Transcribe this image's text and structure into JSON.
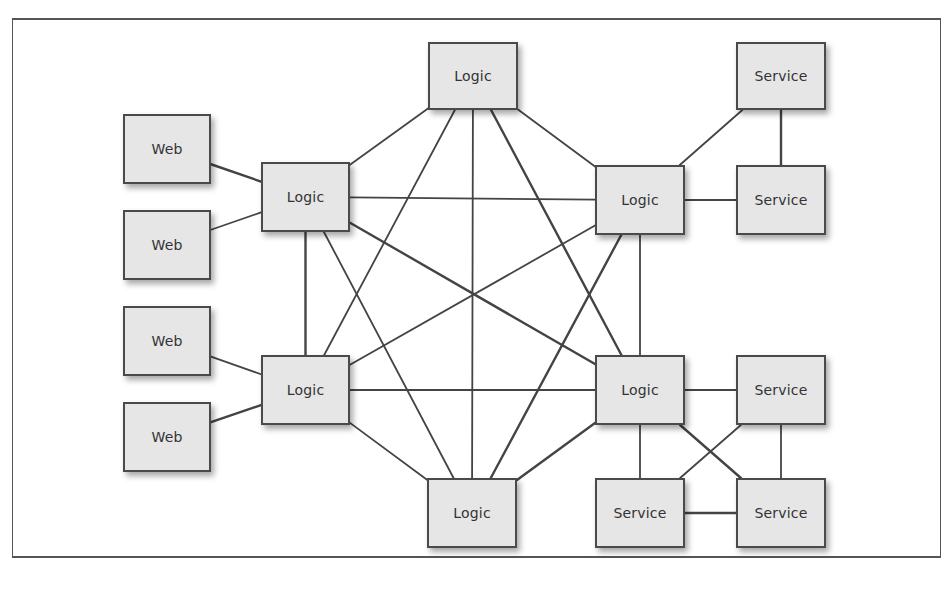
{
  "diagram": {
    "nodes": [
      {
        "id": "logic-top",
        "label": "Logic",
        "x": 428,
        "y": 42,
        "w": 90,
        "h": 68
      },
      {
        "id": "service-1",
        "label": "Service",
        "x": 736,
        "y": 42,
        "w": 90,
        "h": 68
      },
      {
        "id": "web-1",
        "label": "Web",
        "x": 123,
        "y": 114,
        "w": 88,
        "h": 70
      },
      {
        "id": "logic-left-1",
        "label": "Logic",
        "x": 261,
        "y": 162,
        "w": 89,
        "h": 70
      },
      {
        "id": "logic-right-1",
        "label": "Logic",
        "x": 595,
        "y": 165,
        "w": 90,
        "h": 70
      },
      {
        "id": "service-2",
        "label": "Service",
        "x": 736,
        "y": 165,
        "w": 90,
        "h": 70
      },
      {
        "id": "web-2",
        "label": "Web",
        "x": 123,
        "y": 210,
        "w": 88,
        "h": 70
      },
      {
        "id": "web-3",
        "label": "Web",
        "x": 123,
        "y": 306,
        "w": 88,
        "h": 70
      },
      {
        "id": "logic-left-2",
        "label": "Logic",
        "x": 261,
        "y": 355,
        "w": 89,
        "h": 70
      },
      {
        "id": "logic-right-2",
        "label": "Logic",
        "x": 595,
        "y": 355,
        "w": 90,
        "h": 70
      },
      {
        "id": "service-3",
        "label": "Service",
        "x": 736,
        "y": 355,
        "w": 90,
        "h": 70
      },
      {
        "id": "web-4",
        "label": "Web",
        "x": 123,
        "y": 402,
        "w": 88,
        "h": 70
      },
      {
        "id": "logic-bottom",
        "label": "Logic",
        "x": 427,
        "y": 478,
        "w": 90,
        "h": 70
      },
      {
        "id": "service-4",
        "label": "Service",
        "x": 595,
        "y": 478,
        "w": 90,
        "h": 70
      },
      {
        "id": "service-5",
        "label": "Service",
        "x": 736,
        "y": 478,
        "w": 90,
        "h": 70
      }
    ],
    "edges": [
      [
        "web-1",
        "logic-left-1"
      ],
      [
        "web-2",
        "logic-left-1"
      ],
      [
        "web-3",
        "logic-left-2"
      ],
      [
        "web-4",
        "logic-left-2"
      ],
      [
        "logic-left-1",
        "logic-top"
      ],
      [
        "logic-top",
        "logic-right-1"
      ],
      [
        "logic-left-1",
        "logic-left-2"
      ],
      [
        "logic-right-1",
        "logic-right-2"
      ],
      [
        "logic-left-2",
        "logic-bottom"
      ],
      [
        "logic-bottom",
        "logic-right-2"
      ],
      [
        "logic-left-1",
        "logic-right-1"
      ],
      [
        "logic-left-2",
        "logic-right-2"
      ],
      [
        "logic-left-1",
        "logic-right-2"
      ],
      [
        "logic-left-2",
        "logic-right-1"
      ],
      [
        "logic-top",
        "logic-left-2"
      ],
      [
        "logic-top",
        "logic-right-2"
      ],
      [
        "logic-top",
        "logic-bottom"
      ],
      [
        "logic-left-1",
        "logic-bottom"
      ],
      [
        "logic-right-1",
        "logic-bottom"
      ],
      [
        "logic-right-1",
        "service-1"
      ],
      [
        "logic-right-1",
        "service-2"
      ],
      [
        "service-1",
        "service-2"
      ],
      [
        "logic-right-2",
        "service-3"
      ],
      [
        "logic-right-2",
        "service-4"
      ],
      [
        "logic-right-2",
        "service-5"
      ],
      [
        "service-3",
        "service-4"
      ],
      [
        "service-3",
        "service-5"
      ],
      [
        "service-4",
        "service-5"
      ]
    ],
    "colors": {
      "node_fill": "#e6e6e6",
      "node_border": "#4a4a4a",
      "edge": "#444444",
      "frame": "#555555"
    }
  }
}
